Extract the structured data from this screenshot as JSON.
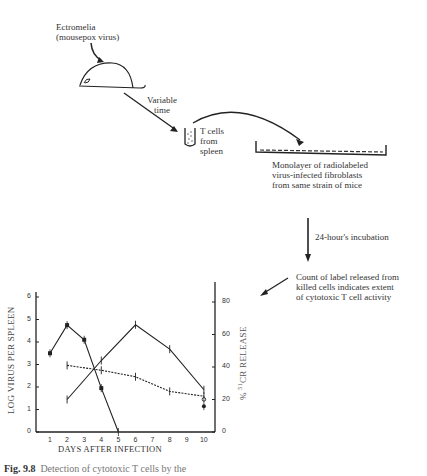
{
  "diagram": {
    "virus_label_line1": "Ectromelia",
    "virus_label_line2": "(mousepox virus)",
    "time_label_line1": "Variable",
    "time_label_line2": "time",
    "tcell_label_line1": "T cells",
    "tcell_label_line2": "from",
    "tcell_label_line3": "spleen",
    "monolayer_line1": "Monolayer of radiolabeled",
    "monolayer_line2": "virus-infected fibroblasts",
    "monolayer_line3": "from same strain of mice",
    "incubation_label": "24-hour's incubation",
    "count_line1": "Count of label released from",
    "count_line2": "killed cells indicates extent",
    "count_line3": "of cytotoxic T cell activity"
  },
  "caption": {
    "fig": "Fig. 9.8",
    "text": "Detection of cytotoxic T cells by the"
  },
  "chart_data": {
    "type": "line",
    "title": "",
    "xlabel": "DAYS AFTER INFECTION",
    "ylabel": "LOG VIRUS PER SPLEEN",
    "ylabel_right": "% 51CR RELEASE",
    "x_ticks": [
      "1",
      "2",
      "3",
      "4",
      "5",
      "6",
      "7",
      "8",
      "9",
      "10"
    ],
    "y_ticks_left": [
      "0",
      "1",
      "2",
      "3",
      "4",
      "5",
      "6"
    ],
    "y_ticks_right": [
      "0",
      "20",
      "40",
      "60",
      "80"
    ],
    "xlim": [
      0,
      10.5
    ],
    "ylim_left": [
      0,
      6.5
    ],
    "ylim_right": [
      0,
      95
    ],
    "grid": false,
    "series": [
      {
        "name": "Virus titer (log per spleen)",
        "axis": "left",
        "marker": "filled-square",
        "x": [
          1,
          2,
          3,
          4,
          5
        ],
        "values": [
          3.5,
          4.75,
          4.1,
          1.95,
          0
        ]
      },
      {
        "name": "Cytotoxic T cell activity (% 51Cr release)",
        "axis": "right",
        "marker": "cross",
        "x": [
          2,
          4,
          6,
          8,
          10
        ],
        "values": [
          20,
          44,
          66,
          51,
          26
        ]
      },
      {
        "name": "Control (% 51Cr release)",
        "axis": "right",
        "marker": "cross",
        "style": "dashed",
        "x": [
          2,
          4,
          6,
          8,
          10
        ],
        "values": [
          41,
          38,
          34,
          25,
          22
        ]
      },
      {
        "name": "Day 10 open point",
        "axis": "left",
        "marker": "open-circle",
        "x": [
          10
        ],
        "values": [
          1.45
        ]
      },
      {
        "name": "Day 10 filled point",
        "axis": "left",
        "marker": "filled-circle",
        "x": [
          10
        ],
        "values": [
          1.15
        ]
      }
    ]
  }
}
